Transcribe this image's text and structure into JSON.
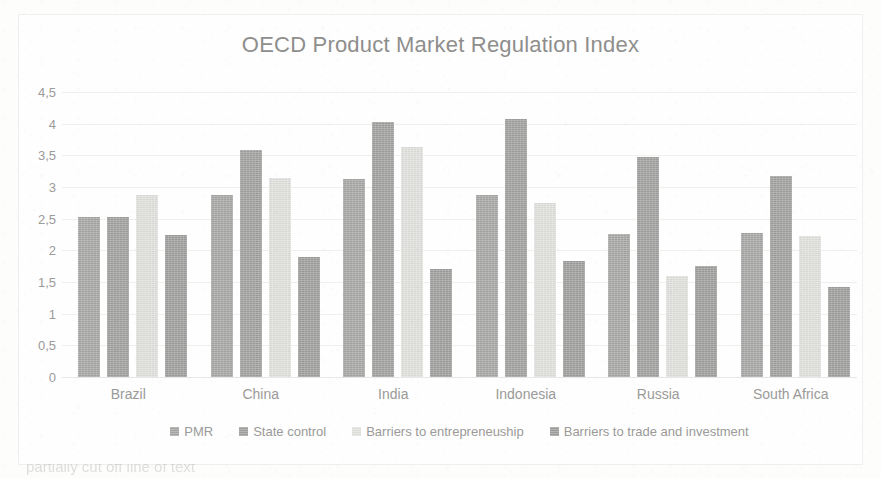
{
  "chart_data": {
    "type": "bar",
    "title": "OECD Product Market Regulation Index",
    "xlabel": "",
    "ylabel": "",
    "ylim": [
      0,
      4.5
    ],
    "ytick_labels": [
      "4,5",
      "4",
      "3,5",
      "3",
      "2,5",
      "2",
      "1,5",
      "1",
      "0,5",
      "0"
    ],
    "ytick_values": [
      4.5,
      4,
      3.5,
      3,
      2.5,
      2,
      1.5,
      1,
      0.5,
      0
    ],
    "grid": true,
    "legend_position": "bottom",
    "categories": [
      "Brazil",
      "China",
      "India",
      "Indonesia",
      "Russia",
      "South Africa"
    ],
    "series": [
      {
        "name": "PMR",
        "color": "#a8a8a6",
        "values": [
          2.53,
          2.87,
          3.12,
          2.87,
          2.26,
          2.28
        ]
      },
      {
        "name": "State control",
        "color": "#a2a2a0",
        "values": [
          2.52,
          3.58,
          4.03,
          4.07,
          3.48,
          3.18
        ]
      },
      {
        "name": "Barriers to entrepreneuship",
        "color": "#e2e2df",
        "values": [
          2.87,
          3.15,
          3.63,
          2.75,
          1.6,
          2.22
        ]
      },
      {
        "name": "Barriers to trade and investment",
        "color": "#a0a09e",
        "values": [
          2.24,
          1.89,
          1.7,
          1.83,
          1.76,
          1.42
        ]
      }
    ]
  },
  "bottom_text": "partially cut off line of text"
}
